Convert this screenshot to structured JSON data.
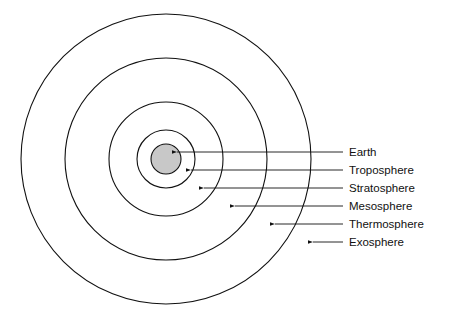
{
  "diagram": {
    "center": {
      "x": 166,
      "y": 159
    },
    "earth": {
      "r": 15,
      "fill": "#c8c8c8"
    },
    "rings": [
      29,
      57,
      101,
      145
    ],
    "labels": [
      {
        "text": "Earth",
        "y": 152,
        "tip": 172
      },
      {
        "text": "Troposphere",
        "y": 170,
        "tip": 186
      },
      {
        "text": "Stratosphere",
        "y": 188,
        "tip": 199
      },
      {
        "text": "Mesosphere",
        "y": 206,
        "tip": 230
      },
      {
        "text": "Thermosphere",
        "y": 224,
        "tip": 270
      },
      {
        "text": "Exosphere",
        "y": 242,
        "tip": 308
      }
    ]
  }
}
